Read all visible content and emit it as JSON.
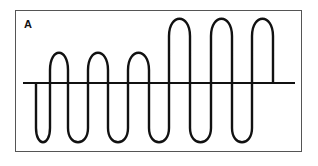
{
  "panel": {
    "label": "A",
    "description": "Waveform: three lower-amplitude upward lobes followed by three higher-amplitude upward lobes, oscillating about a horizontal baseline",
    "colors": {
      "stroke": "#111111",
      "frame": "#555555",
      "background": "#ffffff"
    }
  }
}
